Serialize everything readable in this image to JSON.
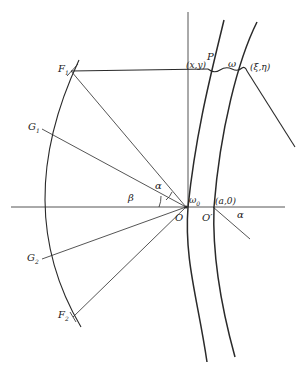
{
  "diagram": {
    "type": "geometric construction",
    "colors": {
      "ink": "#2a2a2a",
      "background": "#ffffff"
    },
    "labels": {
      "P": "P",
      "P_coords": "(x,y)",
      "omega": "ω",
      "xi_eta": "(ξ,η)",
      "F1": "F",
      "F1_sub": "1",
      "G1": "G",
      "G1_sub": "1",
      "G2": "G",
      "G2_sub": "2",
      "F2": "F",
      "F2_sub": "2",
      "alpha_left": "α",
      "beta": "β",
      "omega0": "ω",
      "omega0_sub": "0",
      "a0": "(a,0)",
      "alpha_right": "α",
      "O": "O",
      "O_prime": "O′"
    },
    "points": {
      "O": [
        186,
        207
      ],
      "O_prime": [
        213,
        207
      ],
      "P": [
        208,
        70
      ],
      "xi_eta": [
        247,
        71
      ],
      "F1": [
        71,
        71
      ],
      "G1": [
        41,
        129
      ],
      "G2": [
        41,
        259
      ],
      "F2": [
        73,
        317
      ]
    }
  }
}
